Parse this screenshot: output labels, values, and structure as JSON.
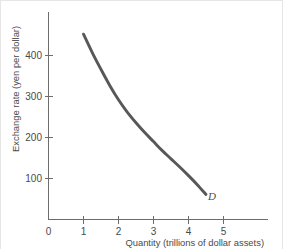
{
  "chart_data": {
    "type": "line",
    "title": "",
    "subtitle": "",
    "xlabel": "Quantity (trillions of dollar assets)",
    "ylabel": "Exchange rate (yen per dollar)",
    "xlim": [
      0,
      5.7
    ],
    "ylim": [
      0,
      470
    ],
    "xticks": [
      0,
      1,
      2,
      3,
      4,
      5
    ],
    "xticklabels": [
      "0",
      "1",
      "2",
      "3",
      "4",
      "5"
    ],
    "yticks": [
      100,
      200,
      300,
      400
    ],
    "yticklabels": [
      "100",
      "200",
      "300",
      "400"
    ],
    "grid": false,
    "legend": false,
    "series": [
      {
        "name": "D",
        "label": "D",
        "label_description": "Demand curve for dollar assets",
        "color": "#585858",
        "x": [
          1.0,
          1.25,
          1.5,
          1.75,
          2.0,
          2.25,
          2.5,
          2.75,
          3.0,
          3.25,
          3.5,
          3.75,
          4.0,
          4.25,
          4.5
        ],
        "y": [
          452,
          407,
          366,
          327,
          292,
          262,
          236,
          212,
          190,
          168,
          148,
          128,
          107,
          85,
          61
        ]
      }
    ],
    "annotations": [
      {
        "text": "D",
        "x": 4.68,
        "y": 48,
        "style": "italic"
      }
    ]
  },
  "axis": {
    "x_tick_labels": [
      "0",
      "1",
      "2",
      "3",
      "4",
      "5"
    ],
    "y_tick_labels": [
      "400",
      "300",
      "200",
      "100"
    ],
    "x_title": "Quantity (trillions of dollar assets)",
    "y_title": "Exchange rate (yen per dollar)"
  },
  "colors": {
    "curve": "#585858",
    "axis": "#6d6d6d",
    "text": "#4a4a4a",
    "background": "#ffffff"
  }
}
